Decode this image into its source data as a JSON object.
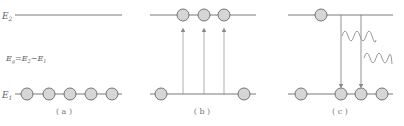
{
  "labels": {
    "E2": "E",
    "E2_sub": "2",
    "E1": "E",
    "E1_sub": "1",
    "Eg": "E",
    "Eg_sub": "g",
    "Eg_eq": "=E",
    "Eg_eq_sub2": "2",
    "Eg_minus": "−E",
    "Eg_minus_sub": "1"
  },
  "panels": [
    {
      "id": "a",
      "caption": "( a )",
      "upper_electrons": 0,
      "lower_electrons": 5,
      "description": "ground state: all electrons at E1"
    },
    {
      "id": "b",
      "caption": "( b )",
      "upper_electrons": 3,
      "lower_electrons": 2,
      "description": "absorption / pumping: electrons excited from E1 to E2"
    },
    {
      "id": "c",
      "caption": "( c )",
      "upper_electrons": 1,
      "lower_electrons": 4,
      "description": "emission: electrons fall from E2 to E1 emitting photons"
    }
  ],
  "colors": {
    "line": "#7a7a7a",
    "electron_fill": "#d6d6d6",
    "electron_stroke": "#666666",
    "arrow": "#888888",
    "photon": "#999999"
  }
}
